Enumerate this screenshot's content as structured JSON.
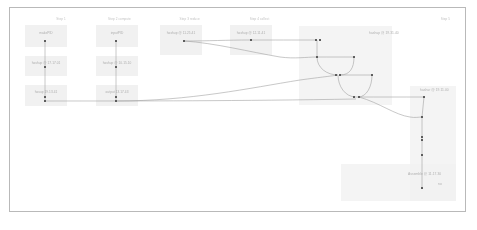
{
  "canvas": {
    "background_color": "#ffffff",
    "border_color": "#b9b9b9",
    "node_marker_color": "#5a5a5a",
    "edge_color": "#9a9a9a",
    "group_fill_color": "#f2f2f2",
    "card_fill_color": "#f0f0f0",
    "label_color": "#b0b0b0"
  },
  "lanes": [
    {
      "id": "lane1",
      "title": "Step 1",
      "x": 172,
      "y": 17
    },
    {
      "id": "lane2",
      "title": "Step 2 compute",
      "x": 330,
      "y": 17
    },
    {
      "id": "lane3",
      "title": "Step 3 reduce",
      "x": 548,
      "y": 17
    },
    {
      "id": "lane4",
      "title": "Step 4 collect",
      "x": 762,
      "y": 17
    },
    {
      "id": "lane5",
      "title": "Step 5",
      "x": 1345,
      "y": 17
    }
  ],
  "groups": [
    {
      "id": "g-merge-main",
      "label": "hashup @ 19.31.40",
      "x": 299,
      "y": 26,
      "w": 93,
      "h": 79,
      "label_x": 369,
      "label_y": 31
    },
    {
      "id": "g-merge-right",
      "label": "hashur @ 19.11.00",
      "x": 410,
      "y": 86,
      "w": 46,
      "h": 115,
      "label_x": 420,
      "label_y": 88
    },
    {
      "id": "g-assemble",
      "label": "Assemble @ 11.17.30",
      "x": 341,
      "y": 164,
      "w": 115,
      "h": 37,
      "label_x": 408,
      "label_y": 172
    },
    {
      "id": "g-assemble-sub",
      "label": "no",
      "x": 341,
      "y": 164,
      "w": 0,
      "h": 0,
      "label_x": 438,
      "label_y": 182
    }
  ],
  "cards": [
    {
      "id": "c1-1",
      "label": "makePID",
      "x": 25,
      "y": 25,
      "w": 42,
      "h": 22,
      "label_x": 46,
      "label_y": 31
    },
    {
      "id": "c1-2",
      "label": "hashup @ 17.17.01",
      "x": 25,
      "y": 56,
      "w": 42,
      "h": 20,
      "label_x": 46,
      "label_y": 61
    },
    {
      "id": "c1-3",
      "label": "hasup 19.13.41",
      "x": 25,
      "y": 85,
      "w": 42,
      "h": 21,
      "label_x": 46,
      "label_y": 90
    },
    {
      "id": "c2-1",
      "label": "inputPID",
      "x": 96,
      "y": 25,
      "w": 42,
      "h": 22,
      "label_x": 117,
      "label_y": 31
    },
    {
      "id": "c2-2",
      "label": "hashup @ 10.15.10",
      "x": 96,
      "y": 56,
      "w": 42,
      "h": 20,
      "label_x": 117,
      "label_y": 61
    },
    {
      "id": "c2-3",
      "label": "output 13.17.43",
      "x": 96,
      "y": 85,
      "w": 42,
      "h": 21,
      "label_x": 117,
      "label_y": 90
    },
    {
      "id": "c3-1",
      "label": "hashup @ 11.25.41",
      "x": 160,
      "y": 25,
      "w": 42,
      "h": 30,
      "label_x": 181,
      "label_y": 31
    },
    {
      "id": "c4-1",
      "label": "hashup @ 12.11.41",
      "x": 230,
      "y": 25,
      "w": 42,
      "h": 30,
      "label_x": 251,
      "label_y": 31
    }
  ],
  "markers": [
    {
      "id": "m1",
      "x": 45,
      "y": 41
    },
    {
      "id": "m2",
      "x": 45,
      "y": 67
    },
    {
      "id": "m3",
      "x": 45,
      "y": 97
    },
    {
      "id": "m4",
      "x": 45,
      "y": 101
    },
    {
      "id": "m5",
      "x": 116,
      "y": 41
    },
    {
      "id": "m6",
      "x": 116,
      "y": 67
    },
    {
      "id": "m7",
      "x": 116,
      "y": 97
    },
    {
      "id": "m8",
      "x": 116,
      "y": 101
    },
    {
      "id": "m9",
      "x": 184,
      "y": 41
    },
    {
      "id": "m10",
      "x": 251,
      "y": 40
    },
    {
      "id": "m11",
      "x": 316,
      "y": 40
    },
    {
      "id": "m12",
      "x": 320,
      "y": 40
    },
    {
      "id": "m13",
      "x": 317,
      "y": 57
    },
    {
      "id": "m14",
      "x": 354,
      "y": 57
    },
    {
      "id": "m15",
      "x": 336,
      "y": 75
    },
    {
      "id": "m16",
      "x": 340,
      "y": 75
    },
    {
      "id": "m17",
      "x": 372,
      "y": 75
    },
    {
      "id": "m18",
      "x": 354,
      "y": 97
    },
    {
      "id": "m19",
      "x": 359,
      "y": 97
    },
    {
      "id": "m20",
      "x": 424,
      "y": 97
    },
    {
      "id": "m21",
      "x": 422,
      "y": 117
    },
    {
      "id": "m22",
      "x": 422,
      "y": 137
    },
    {
      "id": "m23",
      "x": 422,
      "y": 140
    },
    {
      "id": "m24",
      "x": 422,
      "y": 155
    },
    {
      "id": "m25",
      "x": 422,
      "y": 188
    }
  ],
  "edges": [
    {
      "id": "e1",
      "d": "M45,41 L45,101"
    },
    {
      "id": "e2",
      "d": "M116,41 L116,101"
    },
    {
      "id": "e3",
      "d": "M184,41 C210,41 225,40 251,40"
    },
    {
      "id": "e4",
      "d": "M251,40 C275,40 292,40 316,40"
    },
    {
      "id": "e5",
      "d": "M184,41 C215,43 250,52 280,57 C295,59 306,57 317,57"
    },
    {
      "id": "e6",
      "d": "M317,40 L317,57"
    },
    {
      "id": "e7",
      "d": "M317,57 C317,68 327,75 338,75"
    },
    {
      "id": "e8",
      "d": "M354,57 C354,68 350,75 340,75"
    },
    {
      "id": "e9",
      "d": "M317,57 C330,57 342,57 354,57"
    },
    {
      "id": "e10",
      "d": "M338,75 C338,86 345,97 356,97"
    },
    {
      "id": "e11",
      "d": "M372,75 C372,86 367,97 358,97"
    },
    {
      "id": "e12",
      "d": "M340,75 C350,75 362,75 372,75"
    },
    {
      "id": "e13",
      "d": "M45,101 C140,101 240,101 356,99"
    },
    {
      "id": "e14",
      "d": "M116,101 C190,101 250,88 300,80 C322,77 332,76 338,75"
    },
    {
      "id": "e15",
      "d": "M356,97 C380,97 400,97 424,97"
    },
    {
      "id": "e16",
      "d": "M359,97 C380,103 395,115 410,117 C415,118 419,117 422,117"
    },
    {
      "id": "e17",
      "d": "M424,97 L422,117"
    },
    {
      "id": "e18",
      "d": "M422,117 L422,188"
    }
  ]
}
